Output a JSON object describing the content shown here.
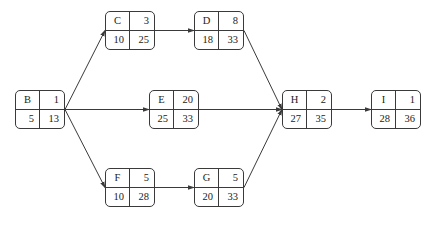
{
  "diagram": {
    "type": "activity-on-node network",
    "node_layout": {
      "top_left": "activity",
      "top_right": "duration",
      "bottom_left": "earliest start",
      "bottom_right": "latest finish"
    },
    "nodes": [
      {
        "id": "B",
        "activity": "B",
        "duration": "1",
        "bottom_left": "5",
        "bottom_right": "13",
        "x": 15,
        "y": 90
      },
      {
        "id": "C",
        "activity": "C",
        "duration": "3",
        "bottom_left": "10",
        "bottom_right": "25",
        "x": 105,
        "y": 11
      },
      {
        "id": "D",
        "activity": "D",
        "duration": "8",
        "bottom_left": "18",
        "bottom_right": "33",
        "x": 194,
        "y": 11
      },
      {
        "id": "E",
        "activity": "E",
        "duration": "20",
        "bottom_left": "25",
        "bottom_right": "33",
        "x": 149,
        "y": 90
      },
      {
        "id": "F",
        "activity": "F",
        "duration": "5",
        "bottom_left": "10",
        "bottom_right": "28",
        "x": 105,
        "y": 168
      },
      {
        "id": "G",
        "activity": "G",
        "duration": "5",
        "bottom_left": "20",
        "bottom_right": "33",
        "x": 194,
        "y": 168
      },
      {
        "id": "H",
        "activity": "H",
        "duration": "2",
        "bottom_left": "27",
        "bottom_right": "35",
        "x": 282,
        "y": 90
      },
      {
        "id": "I",
        "activity": "I",
        "duration": "1",
        "bottom_left": "28",
        "bottom_right": "36",
        "x": 371,
        "y": 90
      }
    ],
    "edges": [
      {
        "from": "B",
        "to": "C"
      },
      {
        "from": "B",
        "to": "E"
      },
      {
        "from": "B",
        "to": "F"
      },
      {
        "from": "C",
        "to": "D"
      },
      {
        "from": "F",
        "to": "G"
      },
      {
        "from": "D",
        "to": "H"
      },
      {
        "from": "E",
        "to": "H"
      },
      {
        "from": "G",
        "to": "H"
      },
      {
        "from": "H",
        "to": "I"
      }
    ],
    "colors": {
      "line": "#3a3a3a",
      "background": "#ffffff"
    }
  }
}
